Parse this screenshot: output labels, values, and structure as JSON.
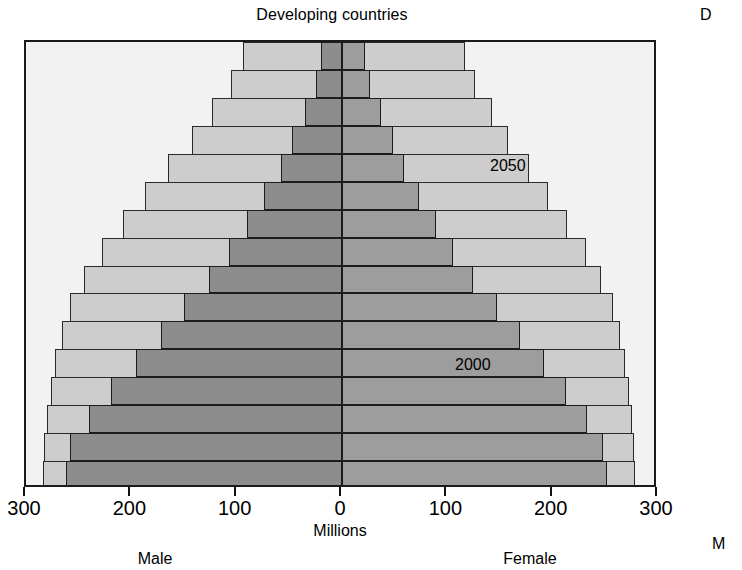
{
  "chart": {
    "title": "Developing countries",
    "neighbour_title_fragment": "D",
    "neighbour_male_fragment": "M",
    "xlabel": "Millions",
    "male_label": "Male",
    "female_label": "Female",
    "series_labels": [
      {
        "name": "label-2050",
        "text": "2050",
        "x": 490,
        "y": 157
      },
      {
        "name": "label-2000",
        "text": "2000",
        "x": 455,
        "y": 356
      }
    ],
    "tick_labels": [
      "300",
      "200",
      "100",
      "0",
      "100",
      "200",
      "300"
    ],
    "tick_values": [
      -300,
      -200,
      -100,
      0,
      100,
      200,
      300
    ],
    "colors": {
      "plot_background": "#f2f2f2",
      "area_2050": "#cdcdcd",
      "bar_2000_male": "#8d8d8d",
      "bar_2000_female": "#9d9d9d",
      "axis": "#1b1b1b"
    }
  },
  "chart_data": {
    "type": "bar",
    "subtype": "population-pyramid",
    "title": "Developing countries",
    "xlabel": "Millions",
    "ylabel": "Age group",
    "xlim": [
      -300,
      300
    ],
    "xticks": [
      -300,
      -200,
      -100,
      0,
      100,
      200,
      300
    ],
    "xticklabels": [
      "300",
      "200",
      "100",
      "0",
      "100",
      "200",
      "300"
    ],
    "grid": false,
    "legend": "in-plot annotations",
    "units": "millions of people",
    "left_side": "Male",
    "right_side": "Female",
    "categories": [
      "75+",
      "70-74",
      "65-69",
      "60-64",
      "55-59",
      "50-54",
      "45-49",
      "40-44",
      "35-39",
      "30-34",
      "25-29",
      "20-24",
      "15-19",
      "10-14",
      "5-9",
      "0-4"
    ],
    "series": [
      {
        "name": "2000",
        "male": [
          20,
          25,
          35,
          47,
          58,
          74,
          90,
          107,
          126,
          150,
          172,
          196,
          219,
          240,
          258,
          262
        ],
        "female": [
          22,
          27,
          37,
          48,
          59,
          73,
          89,
          105,
          124,
          147,
          169,
          192,
          213,
          233,
          248,
          252
        ]
      },
      {
        "name": "2050",
        "male": [
          94,
          105,
          123,
          142,
          165,
          187,
          208,
          228,
          245,
          258,
          266,
          272,
          276,
          280,
          283,
          284
        ],
        "female": [
          117,
          126,
          142,
          158,
          178,
          196,
          214,
          232,
          246,
          257,
          264,
          269,
          272,
          275,
          277,
          278
        ]
      }
    ]
  }
}
